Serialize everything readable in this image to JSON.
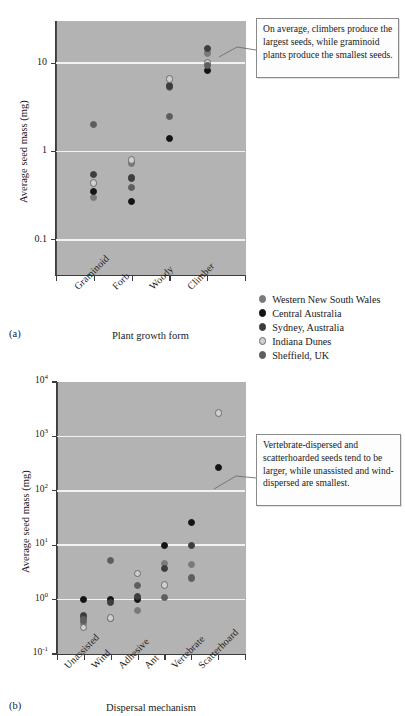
{
  "figure": {
    "panel_a_label": "(a)",
    "panel_b_label": "(b)"
  },
  "legend": {
    "items": [
      {
        "label": "Western New South Wales",
        "color": "#7a7a7a",
        "style": "filled-gray"
      },
      {
        "label": "Central Australia",
        "color": "#141414",
        "style": "filled-black"
      },
      {
        "label": "Sydney, Australia",
        "color": "#3d3d3d",
        "style": "filled-darkgray"
      },
      {
        "label": "Indiana Dunes",
        "color": "#c9c9c9",
        "style": "open-light"
      },
      {
        "label": "Sheffield, UK",
        "color": "#5e5e5e",
        "style": "filled-midgray"
      }
    ]
  },
  "annotations": {
    "panel_a": "On average, climbers produce the largest seeds, while graminoid plants produce the smallest seeds.",
    "panel_b": "Vertebrate-dispersed and scatterhoarded seeds tend to be larger, while unassisted and wind-dispersed are smallest."
  },
  "chart_data": [
    {
      "id": "panel-a",
      "type": "scatter",
      "title": "",
      "xlabel": "Plant growth form",
      "ylabel": "Average seed mass (mg)",
      "yscale": "log",
      "ylim": [
        0.04,
        30
      ],
      "ytick_labels": [
        "10",
        "1",
        "0.1"
      ],
      "ytick_values": [
        10,
        1,
        0.1
      ],
      "grid": "horizontal",
      "legend_position": "outside-right-bottom",
      "categories": [
        "Graminoid",
        "Forb",
        "Woody",
        "Climber"
      ],
      "series": [
        {
          "name": "Western New South Wales",
          "color": "#7a7a7a",
          "points": [
            {
              "category": "Graminoid",
              "value": 0.3
            },
            {
              "category": "Forb",
              "value": 0.74
            },
            {
              "category": "Woody",
              "value": 5.3
            },
            {
              "category": "Climber",
              "value": 13.0
            }
          ]
        },
        {
          "name": "Central Australia",
          "color": "#141414",
          "points": [
            {
              "category": "Graminoid",
              "value": 0.35
            },
            {
              "category": "Forb",
              "value": 0.27
            },
            {
              "category": "Woody",
              "value": 1.4
            },
            {
              "category": "Climber",
              "value": 8.2
            }
          ]
        },
        {
          "name": "Sydney, Australia",
          "color": "#3d3d3d",
          "points": [
            {
              "category": "Graminoid",
              "value": 0.55
            },
            {
              "category": "Forb",
              "value": 0.5
            },
            {
              "category": "Woody",
              "value": 5.5
            },
            {
              "category": "Climber",
              "value": 14.5
            }
          ]
        },
        {
          "name": "Indiana Dunes",
          "color": "#c9c9c9",
          "points": [
            {
              "category": "Graminoid",
              "value": 0.44
            },
            {
              "category": "Forb",
              "value": 0.8
            },
            {
              "category": "Woody",
              "value": 6.6
            },
            {
              "category": "Climber",
              "value": 10.2
            }
          ]
        },
        {
          "name": "Sheffield, UK",
          "color": "#5e5e5e",
          "points": [
            {
              "category": "Graminoid",
              "value": 2.0
            },
            {
              "category": "Forb",
              "value": 0.39
            },
            {
              "category": "Woody",
              "value": 2.5
            },
            {
              "category": "Climber",
              "value": 9.5
            }
          ]
        }
      ]
    },
    {
      "id": "panel-b",
      "type": "scatter",
      "title": "",
      "xlabel": "Dispersal mechanism",
      "ylabel": "Average seed mass (mg)",
      "yscale": "log",
      "ylim": [
        0.1,
        10000
      ],
      "ytick_labels": [
        "10^4",
        "10^3",
        "10^2",
        "10^1",
        "10^0",
        "10^-1"
      ],
      "ytick_values": [
        10000,
        1000,
        100,
        10,
        1,
        0.1
      ],
      "grid": "horizontal",
      "legend_position": "shared-with-panel-a",
      "categories": [
        "Unassisted",
        "Wind",
        "Adhesive",
        "Ant",
        "Vertebrate",
        "Scatterhoard"
      ],
      "series": [
        {
          "name": "Western New South Wales",
          "color": "#7a7a7a",
          "points": [
            {
              "category": "Unassisted",
              "value": 0.36
            },
            {
              "category": "Wind",
              "value": 0.45
            },
            {
              "category": "Adhesive",
              "value": 0.63
            },
            {
              "category": "Ant",
              "value": 4.6
            },
            {
              "category": "Vertebrate",
              "value": 4.4
            }
          ]
        },
        {
          "name": "Central Australia",
          "color": "#141414",
          "points": [
            {
              "category": "Unassisted",
              "value": 1.0
            },
            {
              "category": "Wind",
              "value": 1.0
            },
            {
              "category": "Adhesive",
              "value": 1.0
            },
            {
              "category": "Ant",
              "value": 9.8
            },
            {
              "category": "Vertebrate",
              "value": 26.0
            },
            {
              "category": "Scatterhoard",
              "value": 270.0
            }
          ]
        },
        {
          "name": "Sydney, Australia",
          "color": "#3d3d3d",
          "points": [
            {
              "category": "Unassisted",
              "value": 0.5
            },
            {
              "category": "Wind",
              "value": 0.87
            },
            {
              "category": "Adhesive",
              "value": 1.15
            },
            {
              "category": "Ant",
              "value": 3.7
            },
            {
              "category": "Vertebrate",
              "value": 9.8
            }
          ]
        },
        {
          "name": "Indiana Dunes",
          "color": "#c9c9c9",
          "points": [
            {
              "category": "Unassisted",
              "value": 0.31
            },
            {
              "category": "Wind",
              "value": 0.46
            },
            {
              "category": "Adhesive",
              "value": 3.0
            },
            {
              "category": "Ant",
              "value": 1.85
            },
            {
              "category": "Scatterhoard",
              "value": 2700.0
            }
          ]
        },
        {
          "name": "Sheffield, UK",
          "color": "#5e5e5e",
          "points": [
            {
              "category": "Unassisted",
              "value": 0.42
            },
            {
              "category": "Wind",
              "value": 5.3
            },
            {
              "category": "Adhesive",
              "value": 1.8
            },
            {
              "category": "Ant",
              "value": 1.1
            },
            {
              "category": "Vertebrate",
              "value": 2.5
            }
          ]
        }
      ]
    }
  ]
}
